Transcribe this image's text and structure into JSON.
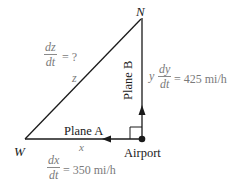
{
  "diagram": {
    "vertices": {
      "north": "N",
      "west": "W",
      "origin": "Airport"
    },
    "planes": {
      "a": {
        "label": "Plane A",
        "side": "x",
        "rate_num": "dx",
        "rate_den": "dt",
        "rate_value": "= 350 mi/h"
      },
      "b": {
        "label": "Plane B",
        "side": "y",
        "rate_num": "dy",
        "rate_den": "dt",
        "rate_value": "= 425 mi/h"
      }
    },
    "hypotenuse": {
      "label": "z",
      "rate_num": "dz",
      "rate_den": "dt",
      "rate_value": "= ?"
    },
    "colors": {
      "line": "#1a1a1a",
      "label_gray": "#7a7a7a"
    }
  }
}
